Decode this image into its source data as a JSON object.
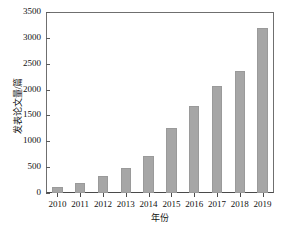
{
  "chart_data": {
    "type": "bar",
    "title": "",
    "xlabel": "年份",
    "ylabel": "发表论文量/篇",
    "categories": [
      "2010",
      "2011",
      "2012",
      "2013",
      "2014",
      "2015",
      "2016",
      "2017",
      "2018",
      "2019"
    ],
    "values": [
      120,
      190,
      320,
      480,
      710,
      1250,
      1680,
      2060,
      2350,
      3200
    ],
    "series": [
      {
        "name": "发表论文量",
        "values": [
          120,
          190,
          320,
          480,
          710,
          1250,
          1680,
          2060,
          2350,
          3200
        ]
      }
    ],
    "ylim": [
      0,
      3500
    ],
    "y_ticks": [
      0,
      500,
      1000,
      1500,
      2000,
      2500,
      3000,
      3500
    ],
    "y_tick_labels": [
      "0",
      "500",
      "1000",
      "1500",
      "2000",
      "2500",
      "3000",
      "3500"
    ],
    "grid": false,
    "legend": null,
    "bar_color": "#a6a6a6",
    "axis_color": "#4a4a4a",
    "background_color": "#ffffff"
  }
}
